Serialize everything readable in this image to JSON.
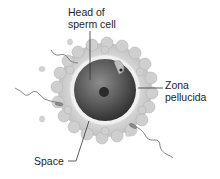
{
  "diagram": {
    "labels": {
      "head_of_sperm_cell": "Head of\nsperm cell",
      "zona_pellucida": "Zona\npellucida",
      "space": "Space"
    },
    "colors": {
      "background": "#ffffff",
      "cell_dark": "#3a3a3a",
      "cell_mid": "#6e6e6e",
      "zona_ring": "#d6d6d6",
      "corona_granules": "#c4c4c4",
      "space_ring": "#f2f2f2",
      "nucleus": "#2a2a2a",
      "text": "#1e1e1e",
      "leader_line": "#333333"
    }
  }
}
